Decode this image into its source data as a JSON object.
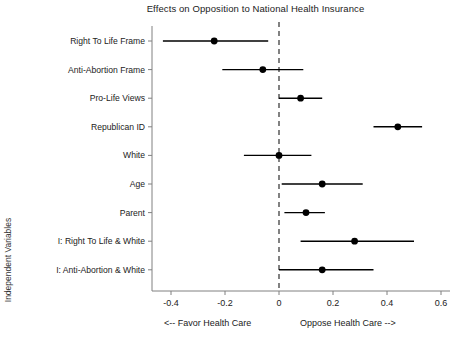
{
  "chart_data": {
    "type": "scatter",
    "subtype": "coefficient-plot-with-confidence-intervals",
    "title": "Effects on Opposition to National Health Insurance",
    "xlabel": "",
    "ylabel": "Independent Variables",
    "xlim": [
      -0.5,
      0.62
    ],
    "xticks": [
      -0.4,
      -0.2,
      0,
      0.2,
      0.4,
      0.6
    ],
    "xtick_labels": [
      "-0.4",
      "-0.2",
      "0",
      "0.2",
      "0.4",
      "0.6"
    ],
    "grid": false,
    "legend": null,
    "reference_line": {
      "x": 0,
      "style": "dashed"
    },
    "categories": [
      "Right To Life Frame",
      "Anti-Abortion Frame",
      "Pro-Life Views",
      "Republican ID",
      "White",
      "Age",
      "Parent",
      "I: Right To Life & White",
      "I: Anti-Abortion & White"
    ],
    "values": [
      -0.24,
      -0.06,
      0.08,
      0.44,
      0.0,
      0.16,
      0.1,
      0.28,
      0.16
    ],
    "ci_low": [
      -0.43,
      -0.21,
      0.0,
      0.35,
      -0.13,
      0.01,
      0.02,
      0.08,
      0.0
    ],
    "ci_high": [
      -0.04,
      0.09,
      0.16,
      0.53,
      0.12,
      0.31,
      0.17,
      0.5,
      0.35
    ],
    "points": [
      {
        "label": "Right To Life Frame",
        "estimate": -0.24,
        "ci_low": -0.43,
        "ci_high": -0.04
      },
      {
        "label": "Anti-Abortion Frame",
        "estimate": -0.06,
        "ci_low": -0.21,
        "ci_high": 0.09
      },
      {
        "label": "Pro-Life Views",
        "estimate": 0.08,
        "ci_low": 0.0,
        "ci_high": 0.16
      },
      {
        "label": "Republican ID",
        "estimate": 0.44,
        "ci_low": 0.35,
        "ci_high": 0.53
      },
      {
        "label": "White",
        "estimate": 0.0,
        "ci_low": -0.13,
        "ci_high": 0.12
      },
      {
        "label": "Age",
        "estimate": 0.16,
        "ci_low": 0.01,
        "ci_high": 0.31
      },
      {
        "label": "Parent",
        "estimate": 0.1,
        "ci_low": 0.02,
        "ci_high": 0.17
      },
      {
        "label": "I: Right To Life & White",
        "estimate": 0.28,
        "ci_low": 0.08,
        "ci_high": 0.5
      },
      {
        "label": "I: Anti-Abortion & White",
        "estimate": 0.16,
        "ci_low": 0.0,
        "ci_high": 0.35
      }
    ],
    "annotations": [
      {
        "name": "favor-note",
        "text": "<-- Favor Health Care",
        "position": "bottom-left"
      },
      {
        "name": "oppose-note",
        "text": "Oppose Health Care -->",
        "position": "bottom-right"
      }
    ],
    "colors": {
      "point": "#000000",
      "interval": "#000000",
      "axis": "#808080",
      "reference_line": "#4d4d4d",
      "text": "#1a1a1a",
      "background": "#ffffff"
    }
  }
}
